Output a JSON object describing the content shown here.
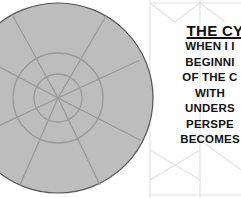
{
  "image": {
    "title": "THE CY",
    "lines": [
      "WHEN I I",
      "BEGINNI",
      "OF THE C",
      "WITH",
      "UNDERS",
      "PERSPE",
      "BECOMES"
    ]
  },
  "colors": {
    "wheel_fill": "#bdbdbd",
    "wheel_lines": "#9a9a9a",
    "wheel_outline": "#555555",
    "pattern_lines": "#e2e2e2",
    "text": "#111111"
  }
}
